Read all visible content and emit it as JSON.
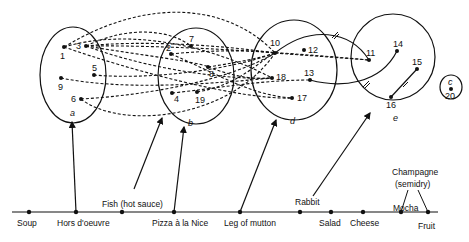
{
  "colors": {
    "ink": "#111111",
    "background": "#ffffff"
  },
  "clusters": [
    {
      "id": "a",
      "label": "a",
      "cx": 73,
      "cy": 75,
      "rx": 33,
      "ry": 48,
      "lx": 70,
      "ly": 116
    },
    {
      "id": "b",
      "label": "b",
      "cx": 196,
      "cy": 76,
      "rx": 38,
      "ry": 48,
      "lx": 188,
      "ly": 126
    },
    {
      "id": "d",
      "label": "d",
      "cx": 294,
      "cy": 70,
      "rx": 43,
      "ry": 50,
      "lx": 290,
      "ly": 124
    },
    {
      "id": "e",
      "label": "e",
      "cx": 393,
      "cy": 57,
      "rx": 42,
      "ry": 43,
      "lx": 393,
      "ly": 121
    },
    {
      "id": "c",
      "label": "c",
      "cx": 451,
      "cy": 87,
      "rx": 11,
      "ry": 12,
      "lx": 448,
      "ly": 85
    }
  ],
  "nodes": [
    {
      "id": "1",
      "label": "1",
      "x": 64,
      "y": 47,
      "lx": 60,
      "ly": 59
    },
    {
      "id": "3",
      "label": "3",
      "x": 86,
      "y": 46,
      "lx": 76,
      "ly": 49
    },
    {
      "id": "5",
      "label": "5",
      "x": 94,
      "y": 75,
      "lx": 92,
      "ly": 71
    },
    {
      "id": "9",
      "label": "9",
      "x": 61,
      "y": 78,
      "lx": 58,
      "ly": 90
    },
    {
      "id": "6",
      "label": "6",
      "x": 81,
      "y": 99,
      "lx": 71,
      "ly": 102
    },
    {
      "id": "7",
      "label": "7",
      "x": 191,
      "y": 46,
      "lx": 189,
      "ly": 42
    },
    {
      "id": "2",
      "label": "2",
      "x": 171,
      "y": 54,
      "lx": 166,
      "ly": 51
    },
    {
      "id": "8",
      "label": "8",
      "x": 208,
      "y": 67,
      "lx": 209,
      "ly": 77
    },
    {
      "id": "4",
      "label": "4",
      "x": 172,
      "y": 93,
      "lx": 174,
      "ly": 102
    },
    {
      "id": "19",
      "label": "19",
      "x": 197,
      "y": 92,
      "lx": 195,
      "ly": 103
    },
    {
      "id": "10",
      "label": "10",
      "x": 275,
      "y": 53,
      "lx": 270,
      "ly": 46
    },
    {
      "id": "12",
      "label": "12",
      "x": 304,
      "y": 50,
      "lx": 308,
      "ly": 53
    },
    {
      "id": "18",
      "label": "18",
      "x": 272,
      "y": 78,
      "lx": 276,
      "ly": 80
    },
    {
      "id": "13",
      "label": "13",
      "x": 310,
      "y": 80,
      "lx": 304,
      "ly": 76
    },
    {
      "id": "17",
      "label": "17",
      "x": 292,
      "y": 98,
      "lx": 297,
      "ly": 101
    },
    {
      "id": "11",
      "label": "11",
      "x": 369,
      "y": 60,
      "lx": 366,
      "ly": 56
    },
    {
      "id": "14",
      "label": "14",
      "x": 397,
      "y": 51,
      "lx": 393,
      "ly": 47
    },
    {
      "id": "15",
      "label": "15",
      "x": 417,
      "y": 69,
      "lx": 412,
      "ly": 65
    },
    {
      "id": "16",
      "label": "16",
      "x": 391,
      "y": 97,
      "lx": 386,
      "ly": 108
    },
    {
      "id": "20",
      "label": "20",
      "x": 451,
      "y": 89,
      "lx": 445,
      "ly": 99
    }
  ],
  "dashed_edges": [
    "M64,47 C150,-5 230,5 275,53",
    "M64,47 C120,30 200,40 272,78",
    "M64,47 C130,70 240,100 292,98",
    "M86,46 C130,25 170,30 191,46",
    "M86,46 C140,40 220,45 275,53",
    "M86,46 C140,55 200,62 208,67",
    "M86,46 C150,70 230,80 272,78",
    "M86,46 C150,45 260,50 369,60",
    "M94,75 C150,80 230,70 275,53",
    "M61,78 C120,90 200,85 272,78",
    "M81,99 C150,95 230,80 275,53",
    "M81,99 C120,130 230,120 275,53",
    "M171,54 C210,50 250,50 275,53",
    "M171,54 C220,75 250,95 292,98",
    "M208,67 C240,62 260,58 275,53",
    "M172,93 C220,88 260,80 310,80",
    "M197,92 C240,85 260,60 275,53",
    "M208,67 C230,75 250,80 272,78",
    "M275,53 L369,60"
  ],
  "solid_edges": [
    {
      "path": "M275,53 C310,25 350,30 369,60",
      "tick_x": 335,
      "tick_y": 35
    },
    {
      "path": "M310,80 C340,88 380,85 397,51",
      "tick_x": 366,
      "tick_y": 84
    },
    {
      "path": "M417,69 L391,97",
      "tick_x": 404,
      "tick_y": 83
    }
  ],
  "timeline": {
    "y": 212,
    "x_start": 12,
    "x_end": 438,
    "dishes": [
      {
        "label": "Soup",
        "x": 29,
        "label_x": 17,
        "label_y": 226
      },
      {
        "label": "Hors d'oeuvre",
        "x": 76,
        "label_x": 57,
        "label_y": 226
      },
      {
        "label": "Fish (hot sauce)",
        "x": 122,
        "label_x": 102,
        "label_y": 207
      },
      {
        "label": "Pizza à la Nice",
        "x": 174,
        "label_x": 152,
        "label_y": 226
      },
      {
        "label": "Leg of mutton",
        "x": 240,
        "label_x": 224,
        "label_y": 226
      },
      {
        "label": "Rabbit",
        "x": 300,
        "label_x": 295,
        "label_y": 205
      },
      {
        "label": "Salad",
        "x": 331,
        "label_x": 319,
        "label_y": 226
      },
      {
        "label": "Cheese",
        "x": 363,
        "label_x": 350,
        "label_y": 226
      },
      {
        "label": "Mocha",
        "x": 401,
        "label_x": 393,
        "label_y": 211
      },
      {
        "label": "Fruit",
        "x": 428,
        "label_x": 418,
        "label_y": 229
      }
    ],
    "champagne": {
      "line1": "Champagne",
      "line2": "(semidry)",
      "x1": 392,
      "y1": 175,
      "x2": 395,
      "y2": 187
    }
  },
  "arrows": [
    {
      "from": "Hors d'oeuvre",
      "path": "M76,212 L72,122"
    },
    {
      "from": "Fish (hot sauce)",
      "path": "M134,189 L162,118"
    },
    {
      "from": "Pizza à la Nice",
      "path": "M174,212 L184,127"
    },
    {
      "from": "Leg of mutton",
      "path": "M240,212 L276,120"
    },
    {
      "from": "Rabbit",
      "path": "M313,196 L370,113"
    }
  ],
  "champagne_links": [
    "M408,190 L401,212",
    "M418,190 L428,212"
  ]
}
